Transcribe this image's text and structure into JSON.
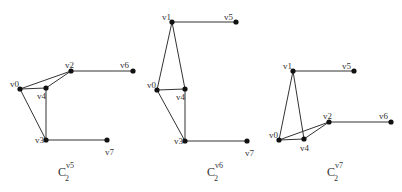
{
  "figure": {
    "graphs": [
      {
        "id": "left",
        "caption": {
          "base": "C",
          "sub": "2",
          "sup": "v5",
          "x": 58,
          "y": 176
        },
        "nodes": [
          {
            "id": "v0",
            "label": "v0",
            "x": 20,
            "y": 89,
            "lx": -10,
            "ly": -2
          },
          {
            "id": "v2",
            "label": "v2",
            "x": 71,
            "y": 71,
            "lx": -6,
            "ly": -3
          },
          {
            "id": "v4",
            "label": "v4",
            "x": 46,
            "y": 88,
            "lx": -9,
            "ly": 11
          },
          {
            "id": "v6",
            "label": "v6",
            "x": 133,
            "y": 71,
            "lx": -13,
            "ly": -3
          },
          {
            "id": "v3",
            "label": "v3",
            "x": 46,
            "y": 140,
            "lx": -11,
            "ly": 3
          },
          {
            "id": "v7",
            "label": "v7",
            "x": 107,
            "y": 140,
            "lx": -2,
            "ly": 15
          }
        ],
        "edges": [
          [
            "v0",
            "v2"
          ],
          [
            "v0",
            "v4"
          ],
          [
            "v4",
            "v2"
          ],
          [
            "v2",
            "v6"
          ],
          [
            "v0",
            "v3"
          ],
          [
            "v4",
            "v3"
          ],
          [
            "v3",
            "v7"
          ]
        ]
      },
      {
        "id": "middle",
        "caption": {
          "base": "C",
          "sub": "2",
          "sup": "v6",
          "x": 207,
          "y": 176
        },
        "nodes": [
          {
            "id": "v1",
            "label": "v1",
            "x": 172,
            "y": 22,
            "lx": -10,
            "ly": -2
          },
          {
            "id": "v5",
            "label": "v5",
            "x": 236,
            "y": 22,
            "lx": -12,
            "ly": -2
          },
          {
            "id": "v0",
            "label": "v0",
            "x": 157,
            "y": 90,
            "lx": -10,
            "ly": -2
          },
          {
            "id": "v4",
            "label": "v4",
            "x": 185,
            "y": 89,
            "lx": -9,
            "ly": 11
          },
          {
            "id": "v3",
            "label": "v3",
            "x": 185,
            "y": 141,
            "lx": -11,
            "ly": 3
          },
          {
            "id": "v7",
            "label": "v7",
            "x": 247,
            "y": 141,
            "lx": -2,
            "ly": 15
          }
        ],
        "edges": [
          [
            "v1",
            "v5"
          ],
          [
            "v1",
            "v0"
          ],
          [
            "v1",
            "v4"
          ],
          [
            "v0",
            "v4"
          ],
          [
            "v0",
            "v3"
          ],
          [
            "v4",
            "v3"
          ],
          [
            "v3",
            "v7"
          ]
        ]
      },
      {
        "id": "right",
        "caption": {
          "base": "C",
          "sub": "2",
          "sup": "v7",
          "x": 327,
          "y": 176
        },
        "nodes": [
          {
            "id": "v1",
            "label": "v1",
            "x": 293,
            "y": 71,
            "lx": -10,
            "ly": -2
          },
          {
            "id": "v5",
            "label": "v5",
            "x": 354,
            "y": 71,
            "lx": -12,
            "ly": -2
          },
          {
            "id": "v2",
            "label": "v2",
            "x": 329,
            "y": 122,
            "lx": -6,
            "ly": -3
          },
          {
            "id": "v6",
            "label": "v6",
            "x": 391,
            "y": 122,
            "lx": -12,
            "ly": -3
          },
          {
            "id": "v0",
            "label": "v0",
            "x": 279,
            "y": 140,
            "lx": -10,
            "ly": -2
          },
          {
            "id": "v4",
            "label": "v4",
            "x": 304,
            "y": 139,
            "lx": -4,
            "ly": 12
          }
        ],
        "edges": [
          [
            "v1",
            "v5"
          ],
          [
            "v1",
            "v0"
          ],
          [
            "v1",
            "v4"
          ],
          [
            "v0",
            "v4"
          ],
          [
            "v0",
            "v2"
          ],
          [
            "v4",
            "v2"
          ],
          [
            "v2",
            "v6"
          ]
        ]
      }
    ]
  }
}
